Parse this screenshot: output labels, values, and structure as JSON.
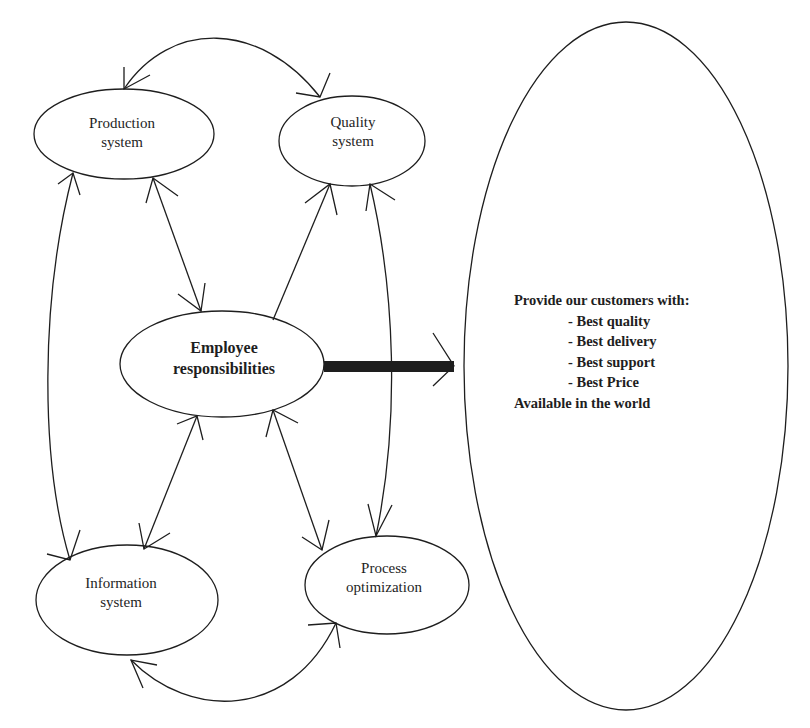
{
  "diagram": {
    "nodes": {
      "production": {
        "line1": "Production",
        "line2": "system"
      },
      "quality": {
        "line1": "Quality",
        "line2": "system"
      },
      "employee": {
        "line1": "Employee",
        "line2": "responsibilities"
      },
      "information": {
        "line1": "Information",
        "line2": "system"
      },
      "process": {
        "line1": "Process",
        "line2": "optimization"
      }
    },
    "goal": {
      "heading": "Provide our customers with:",
      "items": [
        "- Best quality",
        "- Best delivery",
        "- Best support",
        "- Best Price"
      ],
      "footer": "Available in the world"
    },
    "colors": {
      "stroke": "#1e1e1e",
      "background": "#ffffff"
    }
  }
}
